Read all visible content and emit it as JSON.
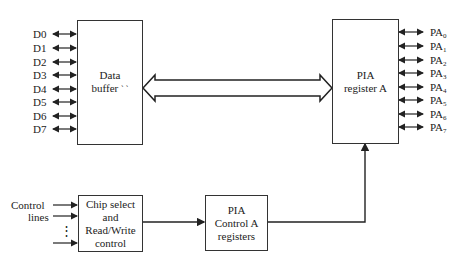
{
  "diagram": {
    "data_buffer": {
      "line1": "Data",
      "line2": "buffer",
      "trailing": "` `"
    },
    "pia_register_a": {
      "line1": "PIA",
      "line2": "register A"
    },
    "chip_select": {
      "line1": "Chip select",
      "line2": "and",
      "line3": "Read/Write",
      "line4": "control"
    },
    "pia_control_a": {
      "line1": "PIA",
      "line2": "Control A",
      "line3": "registers"
    },
    "control_lines": {
      "line1": "Control",
      "line2": "lines",
      "ellipsis": "⋮"
    },
    "data_lines": [
      "D0",
      "D1",
      "D2",
      "D3",
      "D4",
      "D5",
      "D6",
      "D7"
    ],
    "port_lines": [
      {
        "base": "PA",
        "sub": "0"
      },
      {
        "base": "PA",
        "sub": "1"
      },
      {
        "base": "PA",
        "sub": "2"
      },
      {
        "base": "PA",
        "sub": "3"
      },
      {
        "base": "PA",
        "sub": "4"
      },
      {
        "base": "PA",
        "sub": "5"
      },
      {
        "base": "PA",
        "sub": "6"
      },
      {
        "base": "PA",
        "sub": "7"
      }
    ]
  }
}
